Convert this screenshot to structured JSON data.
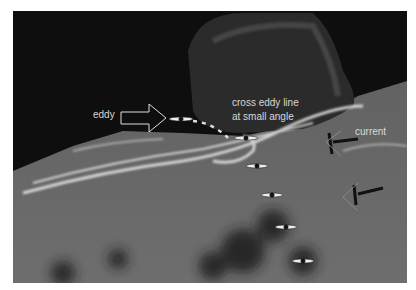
{
  "figure": {
    "type": "annotated-photo",
    "labels": {
      "eddy": "eddy",
      "cross_line_1": "cross eddy line",
      "cross_line_2": "at small angle",
      "current": "current"
    },
    "colors": {
      "label_text": "#d8d8d8",
      "water": "#6a6a6a",
      "rock": "#1a1a1a",
      "foam": "#e6e6e6"
    },
    "kayak_count": 6
  }
}
